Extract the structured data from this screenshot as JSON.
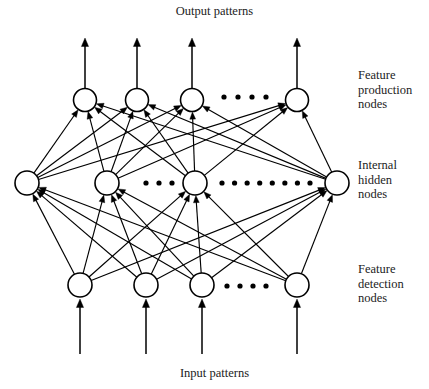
{
  "diagram": {
    "title_top": "Output patterns",
    "title_bottom": "Input patterns",
    "stroke_color": "#000000",
    "node_fill": "#ffffff",
    "background": "#ffffff",
    "layer_labels": [
      {
        "id": "feature-production",
        "lines": [
          "Feature",
          "production",
          "nodes"
        ]
      },
      {
        "id": "internal-hidden",
        "lines": [
          "Internal",
          "hidden",
          "nodes"
        ]
      },
      {
        "id": "feature-detection",
        "lines": [
          "Feature",
          "detection",
          "nodes"
        ]
      }
    ],
    "layers": [
      {
        "id": "feature-production-layer",
        "name": "Feature production nodes",
        "y": 100,
        "radius": 11.5,
        "nodes": [
          {
            "id": "fp-1",
            "x": 85
          },
          {
            "id": "fp-2",
            "x": 137
          },
          {
            "id": "fp-3",
            "x": 192
          },
          {
            "id": "fp-n",
            "x": 297
          }
        ],
        "ellipsis": [
          {
            "after_index": 2,
            "count": 4,
            "x_start": 224,
            "x_end": 266,
            "y": 97
          }
        ]
      },
      {
        "id": "internal-hidden-layer",
        "name": "Internal hidden nodes",
        "y": 183,
        "radius": 12,
        "nodes": [
          {
            "id": "ih-1",
            "x": 27
          },
          {
            "id": "ih-2",
            "x": 107
          },
          {
            "id": "ih-3",
            "x": 195
          },
          {
            "id": "ih-n",
            "x": 337
          }
        ],
        "ellipsis": [
          {
            "after_index": 1,
            "count": 3,
            "x_start": 146,
            "x_end": 172,
            "y": 183
          },
          {
            "after_index": 2,
            "count": 8,
            "x_start": 222,
            "x_end": 310,
            "y": 183
          }
        ]
      },
      {
        "id": "feature-detection-layer",
        "name": "Feature detection nodes",
        "y": 285,
        "radius": 12,
        "nodes": [
          {
            "id": "fd-1",
            "x": 80
          },
          {
            "id": "fd-2",
            "x": 146
          },
          {
            "id": "fd-3",
            "x": 202
          },
          {
            "id": "fd-n",
            "x": 297
          }
        ],
        "ellipsis": [
          {
            "after_index": 2,
            "count": 4,
            "x_start": 227,
            "x_end": 266,
            "y": 286
          }
        ]
      }
    ],
    "output_arrows": {
      "from_y": 88,
      "to_y": 38,
      "x_positions": [
        85,
        137,
        192,
        297
      ]
    },
    "input_arrows": {
      "from_y": 354,
      "to_y": 299,
      "x_positions": [
        80,
        146,
        202,
        297
      ]
    },
    "connections_hidden_to_production": [
      [
        "ih-1",
        "fp-1"
      ],
      [
        "ih-1",
        "fp-2"
      ],
      [
        "ih-1",
        "fp-3"
      ],
      [
        "ih-1",
        "fp-n"
      ],
      [
        "ih-2",
        "fp-1"
      ],
      [
        "ih-2",
        "fp-2"
      ],
      [
        "ih-2",
        "fp-3"
      ],
      [
        "ih-2",
        "fp-n"
      ],
      [
        "ih-3",
        "fp-1"
      ],
      [
        "ih-3",
        "fp-2"
      ],
      [
        "ih-3",
        "fp-3"
      ],
      [
        "ih-3",
        "fp-n"
      ],
      [
        "ih-n",
        "fp-1"
      ],
      [
        "ih-n",
        "fp-2"
      ],
      [
        "ih-n",
        "fp-3"
      ],
      [
        "ih-n",
        "fp-n"
      ]
    ],
    "connections_detection_to_hidden": [
      [
        "fd-1",
        "ih-1"
      ],
      [
        "fd-1",
        "ih-2"
      ],
      [
        "fd-1",
        "ih-3"
      ],
      [
        "fd-1",
        "ih-n"
      ],
      [
        "fd-2",
        "ih-1"
      ],
      [
        "fd-2",
        "ih-2"
      ],
      [
        "fd-2",
        "ih-3"
      ],
      [
        "fd-2",
        "ih-n"
      ],
      [
        "fd-3",
        "ih-1"
      ],
      [
        "fd-3",
        "ih-2"
      ],
      [
        "fd-3",
        "ih-3"
      ],
      [
        "fd-3",
        "ih-n"
      ],
      [
        "fd-n",
        "ih-1"
      ],
      [
        "fd-n",
        "ih-2"
      ],
      [
        "fd-n",
        "ih-3"
      ],
      [
        "fd-n",
        "ih-n"
      ]
    ]
  }
}
